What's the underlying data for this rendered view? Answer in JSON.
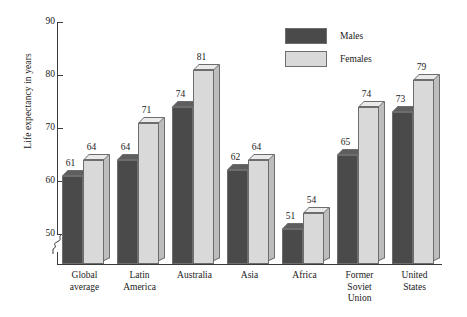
{
  "chart_data": {
    "type": "bar",
    "title": "",
    "xlabel": "",
    "ylabel": "Life expectancy in years",
    "ylim": [
      50,
      90
    ],
    "yticks": [
      50,
      60,
      70,
      80,
      90
    ],
    "axis_break": true,
    "grid": false,
    "legend_position": "top-right",
    "categories": [
      "Global average",
      "Latin America",
      "Australia",
      "Asia",
      "Africa",
      "Former Soviet Union",
      "United States"
    ],
    "category_lines": [
      [
        "Global",
        "average"
      ],
      [
        "Latin",
        "America"
      ],
      [
        "Australia"
      ],
      [
        "Asia"
      ],
      [
        "Africa"
      ],
      [
        "Former",
        "Soviet",
        "Union"
      ],
      [
        "United",
        "States"
      ]
    ],
    "series": [
      {
        "name": "Males",
        "color": "#4a4a4a",
        "values": [
          61,
          64,
          74,
          62,
          51,
          65,
          73
        ]
      },
      {
        "name": "Females",
        "color": "#d9d9d9",
        "values": [
          64,
          71,
          81,
          64,
          54,
          74,
          79
        ]
      }
    ]
  },
  "legend": {
    "items": [
      {
        "label": "Males"
      },
      {
        "label": "Females"
      }
    ]
  },
  "colors": {
    "males": "#4a4a4a",
    "females": "#d9d9d9",
    "axis": "#3a3a3a",
    "outline": "#6d6d6d",
    "background": "#ffffff"
  }
}
